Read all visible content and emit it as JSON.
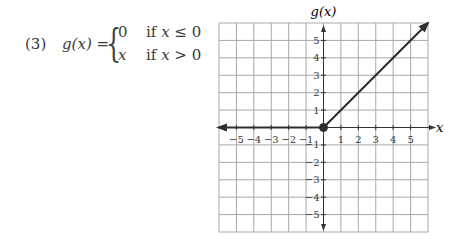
{
  "problem": {
    "number": "(3)",
    "function_name": "g(x)",
    "equals": "=",
    "cases": [
      {
        "value": "0",
        "condition_prefix": "if ",
        "var": "x",
        "op": " ≤ 0"
      },
      {
        "value": "x",
        "condition_prefix": "if ",
        "var": "x",
        "op": " > 0"
      }
    ]
  },
  "chart_data": {
    "type": "line",
    "title": "",
    "xlabel": "x",
    "ylabel": "g(x)",
    "xlim": [
      -6,
      6
    ],
    "ylim": [
      -6,
      6
    ],
    "grid": true,
    "x_ticks": [
      -5,
      -4,
      -3,
      -2,
      -1,
      1,
      2,
      3,
      4,
      5
    ],
    "y_ticks": [
      -5,
      -4,
      -3,
      -2,
      -1,
      1,
      2,
      3,
      4,
      5
    ],
    "series": [
      {
        "name": "g(x) = 0, x ≤ 0",
        "x": [
          -6,
          0
        ],
        "y": [
          0,
          0
        ],
        "arrow_left": true
      },
      {
        "name": "g(x) = x, x > 0",
        "x": [
          0,
          6
        ],
        "y": [
          0,
          6
        ],
        "arrow_right": true
      }
    ],
    "points": [
      {
        "x": 0,
        "y": 0,
        "filled": true
      }
    ],
    "colors": {
      "grid": "#a8a8a8",
      "axis": "#333333",
      "line": "#2e2e2e"
    }
  }
}
